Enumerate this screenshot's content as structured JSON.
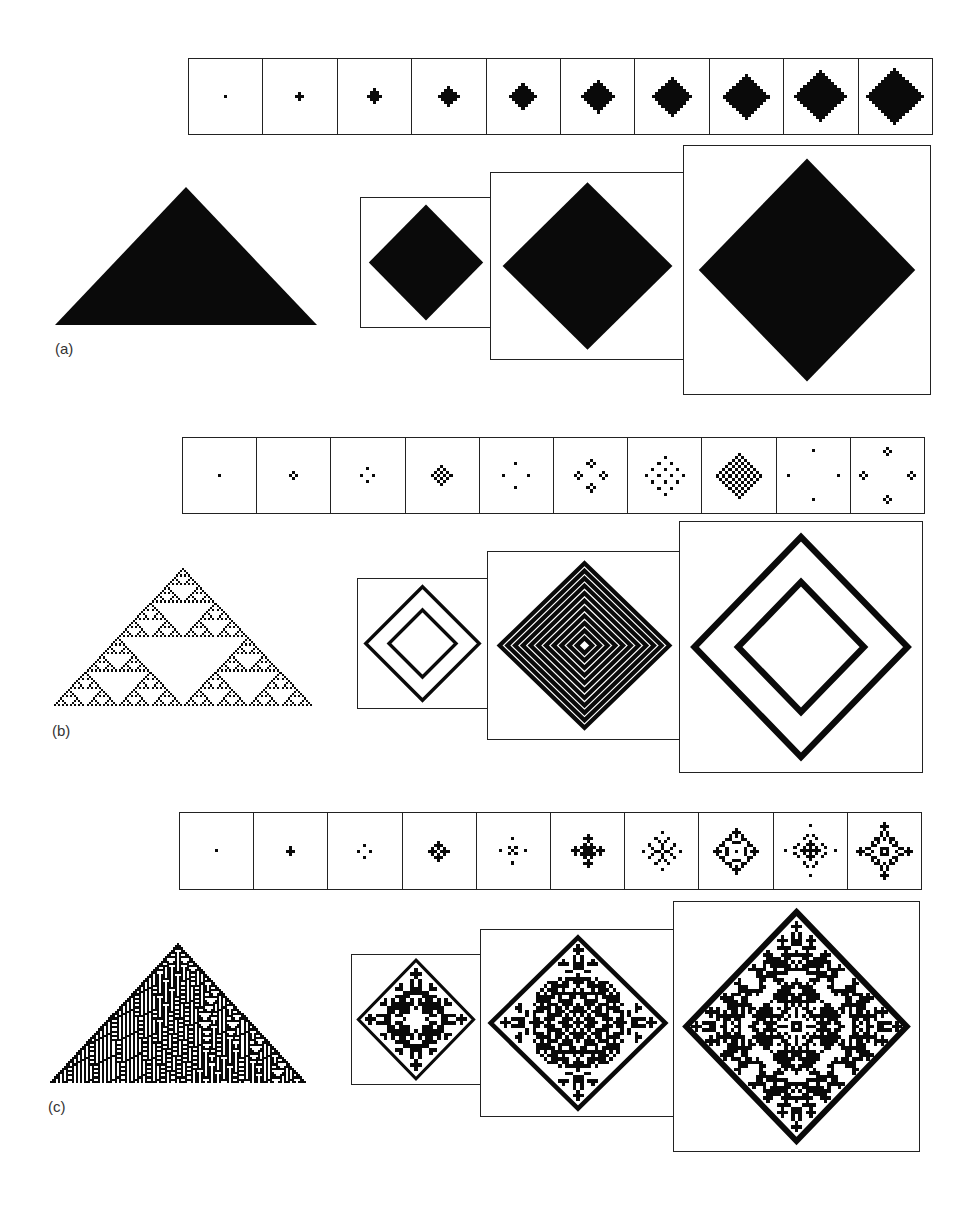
{
  "figure": {
    "panels": [
      {
        "id": "a",
        "label": "(a)",
        "rule_kind": "solid",
        "triangle": {
          "x": 55,
          "y": 187,
          "w": 262,
          "h": 138
        },
        "label_pos": {
          "x": 55,
          "y": 340
        },
        "strip": {
          "x": 188,
          "y": 58,
          "w": 745,
          "h": 77,
          "steps": [
            1,
            2,
            3,
            4,
            5,
            6,
            7,
            8,
            9,
            10
          ]
        },
        "big_boxes": [
          {
            "x": 360,
            "y": 197,
            "w": 132,
            "h": 131,
            "step": 14
          },
          {
            "x": 490,
            "y": 172,
            "w": 195,
            "h": 188,
            "step": 22
          },
          {
            "x": 683,
            "y": 145,
            "w": 248,
            "h": 250,
            "step": 30
          }
        ]
      },
      {
        "id": "b",
        "label": "(b)",
        "rule_kind": "sierpinski",
        "triangle": {
          "x": 52,
          "y": 568,
          "w": 262,
          "h": 138
        },
        "label_pos": {
          "x": 52,
          "y": 722
        },
        "strip": {
          "x": 182,
          "y": 437,
          "w": 743,
          "h": 77,
          "steps": [
            1,
            2,
            3,
            4,
            5,
            6,
            7,
            8,
            9,
            10
          ]
        },
        "big_boxes": [
          {
            "x": 357,
            "y": 578,
            "w": 131,
            "h": 131,
            "step": 12
          },
          {
            "x": 487,
            "y": 551,
            "w": 195,
            "h": 189,
            "step": 16
          },
          {
            "x": 679,
            "y": 521,
            "w": 244,
            "h": 252,
            "step": 24
          }
        ]
      },
      {
        "id": "c",
        "label": "(c)",
        "rule_kind": "complex",
        "triangle": {
          "x": 48,
          "y": 943,
          "w": 260,
          "h": 140
        },
        "label_pos": {
          "x": 48,
          "y": 1098
        },
        "strip": {
          "x": 179,
          "y": 812,
          "w": 743,
          "h": 78,
          "steps": [
            1,
            2,
            3,
            4,
            5,
            6,
            7,
            8,
            9,
            10
          ]
        },
        "big_boxes": [
          {
            "x": 351,
            "y": 954,
            "w": 130,
            "h": 131,
            "step": 14
          },
          {
            "x": 480,
            "y": 929,
            "w": 196,
            "h": 188,
            "step": 22
          },
          {
            "x": 673,
            "y": 901,
            "w": 247,
            "h": 251,
            "step": 30
          }
        ]
      }
    ],
    "colors": {
      "ink": "#0a0a0a",
      "frame": "#222222",
      "paper": "#ffffff"
    }
  }
}
